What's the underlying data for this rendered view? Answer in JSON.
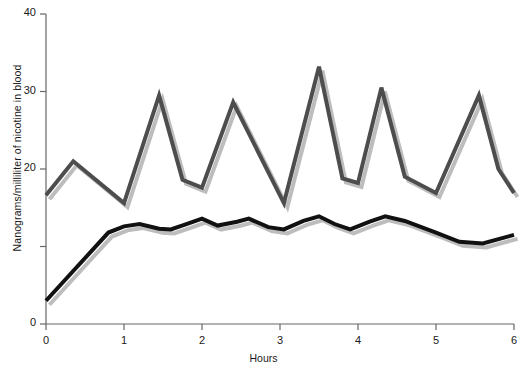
{
  "chart_data": {
    "type": "line",
    "title": "",
    "xlabel": "Hours",
    "ylabel": "Nanograms/milliliter of nicotine in blood",
    "xlim": [
      0,
      6
    ],
    "ylim": [
      0,
      40
    ],
    "xticks": [
      0,
      1,
      2,
      3,
      4,
      5,
      6
    ],
    "xtick_labels": [
      "0",
      "1",
      "2",
      "3",
      "4",
      "5",
      "6"
    ],
    "yticks": [
      0,
      10,
      20,
      30,
      40
    ],
    "ytick_labels": [
      "0",
      "",
      "20",
      "30",
      "40"
    ],
    "grid": false,
    "legend": "none",
    "series": [
      {
        "name": "cigarette-smoker",
        "color": "#4d4d4d",
        "linewidth": 4,
        "points": [
          [
            0.0,
            16.6
          ],
          [
            0.35,
            21.0
          ],
          [
            1.0,
            15.6
          ],
          [
            1.45,
            29.5
          ],
          [
            1.75,
            18.6
          ],
          [
            2.0,
            17.6
          ],
          [
            2.4,
            28.6
          ],
          [
            3.05,
            15.6
          ],
          [
            3.5,
            33.2
          ],
          [
            3.8,
            18.8
          ],
          [
            4.0,
            18.2
          ],
          [
            4.3,
            30.5
          ],
          [
            4.6,
            19.0
          ],
          [
            5.0,
            16.9
          ],
          [
            5.55,
            29.5
          ],
          [
            5.8,
            20.0
          ],
          [
            6.0,
            16.9
          ]
        ]
      },
      {
        "name": "nicotine-patch-user",
        "color": "#111111",
        "linewidth": 4,
        "points": [
          [
            0.0,
            3.0
          ],
          [
            0.8,
            11.8
          ],
          [
            1.0,
            12.6
          ],
          [
            1.2,
            12.9
          ],
          [
            1.45,
            12.3
          ],
          [
            1.6,
            12.2
          ],
          [
            1.8,
            12.9
          ],
          [
            2.0,
            13.6
          ],
          [
            2.2,
            12.7
          ],
          [
            2.45,
            13.2
          ],
          [
            2.6,
            13.6
          ],
          [
            2.85,
            12.5
          ],
          [
            3.05,
            12.2
          ],
          [
            3.3,
            13.3
          ],
          [
            3.5,
            13.9
          ],
          [
            3.7,
            12.9
          ],
          [
            3.9,
            12.2
          ],
          [
            4.15,
            13.2
          ],
          [
            4.35,
            13.9
          ],
          [
            4.6,
            13.3
          ],
          [
            5.0,
            11.8
          ],
          [
            5.3,
            10.6
          ],
          [
            5.6,
            10.4
          ],
          [
            6.0,
            11.5
          ]
        ]
      }
    ]
  },
  "axes": {
    "y_title": "Nanograms/milliliter of nicotine in blood",
    "x_title": "Hours"
  },
  "colors": {
    "line_gray": "#4d4d4d",
    "line_black": "#111111",
    "axis": "#666666",
    "shadow": "#bdbdbd",
    "background": "#ffffff"
  }
}
